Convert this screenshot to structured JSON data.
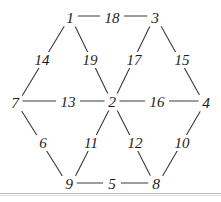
{
  "diagram": {
    "type": "graph",
    "background_color": "#ffffff",
    "line_color": "#3a3a3a",
    "text_color": "#1c1c1c",
    "rule_color": "#b9b9b9",
    "vertices": [
      {
        "id": "v1",
        "label": "1",
        "x": 70,
        "y": 18
      },
      {
        "id": "v3",
        "label": "3",
        "x": 155,
        "y": 18
      },
      {
        "id": "v7",
        "label": "7",
        "x": 15,
        "y": 103
      },
      {
        "id": "v2",
        "label": "2",
        "x": 112,
        "y": 102
      },
      {
        "id": "v4",
        "label": "4",
        "x": 206,
        "y": 103
      },
      {
        "id": "v9",
        "label": "9",
        "x": 69,
        "y": 184
      },
      {
        "id": "v8",
        "label": "8",
        "x": 156,
        "y": 184
      }
    ],
    "edges": [
      {
        "id": "e18",
        "label": "18",
        "from": "v1",
        "to": "v3",
        "label_x": 112,
        "label_y": 18
      },
      {
        "id": "e14",
        "label": "14",
        "from": "v1",
        "to": "v7",
        "label_x": 42,
        "label_y": 60
      },
      {
        "id": "e19",
        "label": "19",
        "from": "v1",
        "to": "v2",
        "label_x": 90,
        "label_y": 60
      },
      {
        "id": "e17",
        "label": "17",
        "from": "v3",
        "to": "v2",
        "label_x": 134,
        "label_y": 60
      },
      {
        "id": "e15",
        "label": "15",
        "from": "v3",
        "to": "v4",
        "label_x": 182,
        "label_y": 60
      },
      {
        "id": "e13",
        "label": "13",
        "from": "v7",
        "to": "v2",
        "label_x": 68,
        "label_y": 102
      },
      {
        "id": "e16",
        "label": "16",
        "from": "v2",
        "to": "v4",
        "label_x": 157,
        "label_y": 102
      },
      {
        "id": "e6",
        "label": "6",
        "from": "v7",
        "to": "v9",
        "label_x": 43,
        "label_y": 143
      },
      {
        "id": "e11",
        "label": "11",
        "from": "v2",
        "to": "v9",
        "label_x": 91,
        "label_y": 143
      },
      {
        "id": "e12",
        "label": "12",
        "from": "v2",
        "to": "v8",
        "label_x": 135,
        "label_y": 143
      },
      {
        "id": "e10",
        "label": "10",
        "from": "v4",
        "to": "v8",
        "label_x": 182,
        "label_y": 143
      },
      {
        "id": "e5",
        "label": "5",
        "from": "v9",
        "to": "v8",
        "label_x": 112,
        "label_y": 184
      }
    ]
  }
}
